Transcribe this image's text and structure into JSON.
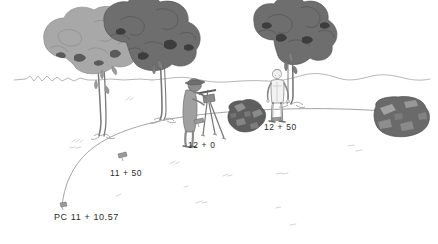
{
  "illustration": {
    "title": "Surveying field sketch of a horizontal curve with stationing",
    "background_color": "#ffffff",
    "width": 438,
    "height": 244
  },
  "labels": {
    "pc_station": "PC  11 + 10.57",
    "station_1150": "11 + 50",
    "station_120": "12 + 0",
    "station_1250": "12 + 50"
  },
  "scene_elements": {
    "horizon_line": "wavy-horizon-line",
    "curve_line": "surveyed-curve-centerline",
    "trees": [
      {
        "name": "tree-left-light",
        "tone": "#a8a8a8"
      },
      {
        "name": "tree-left-dark",
        "tone": "#6e6e6e"
      },
      {
        "name": "tree-right-dark",
        "tone": "#6e6e6e"
      }
    ],
    "boulders": [
      {
        "name": "boulder-center",
        "tone": "#5e5e5e"
      },
      {
        "name": "boulder-right",
        "tone": "#6a6a6a"
      }
    ],
    "figures": [
      {
        "name": "surveyor-with-instrument",
        "tone": "#8c8c8c"
      },
      {
        "name": "rodman-standing",
        "tone": "#e8e8e8"
      }
    ],
    "instrument": {
      "name": "tripod-theodolite",
      "tone": "#6b6b6b"
    },
    "station_markers": [
      "pc-point-marker",
      "marker-1150",
      "marker-120",
      "marker-1250"
    ],
    "ground_tufts": "scattered-grass-tufts"
  },
  "colors": {
    "ink": "#4a4a4a",
    "ink_dark": "#2b2b2b",
    "tree_light": "#a8a8a8",
    "tree_dark": "#6e6e6e",
    "rock": "#5e5e5e",
    "line": "#9a9a9a"
  }
}
